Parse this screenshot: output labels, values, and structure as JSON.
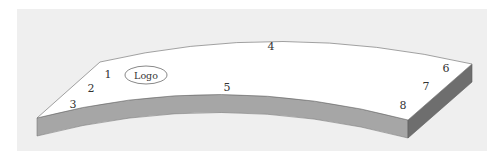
{
  "diagram": {
    "colors": {
      "background_panel": "#efefef",
      "top_face": "#ffffff",
      "front_face": "#a6a6a6",
      "side_face": "#6e6e6e",
      "outline": "#7a7a7a",
      "label": "#333333"
    },
    "logo": {
      "label": "Logo"
    },
    "points": [
      {
        "id": "1",
        "label": "1",
        "x": 108,
        "y": 78
      },
      {
        "id": "2",
        "label": "2",
        "x": 91,
        "y": 92
      },
      {
        "id": "3",
        "label": "3",
        "x": 73,
        "y": 108
      },
      {
        "id": "4",
        "label": "4",
        "x": 271,
        "y": 50
      },
      {
        "id": "5",
        "label": "5",
        "x": 227,
        "y": 91
      },
      {
        "id": "6",
        "label": "6",
        "x": 446,
        "y": 72
      },
      {
        "id": "7",
        "label": "7",
        "x": 426,
        "y": 90
      },
      {
        "id": "8",
        "label": "8",
        "x": 403,
        "y": 109
      }
    ]
  }
}
